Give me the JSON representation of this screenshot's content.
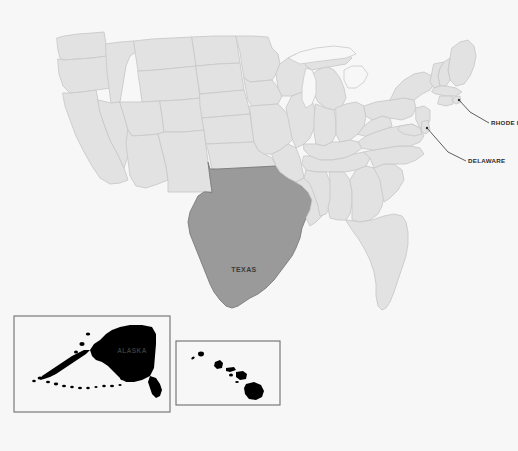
{
  "map": {
    "title": "United States map with Texas highlighted",
    "background_color": "#f7f7f7",
    "state_fill": "#e2e2e2",
    "state_stroke": "#c9c9c9",
    "highlight_fill": "#9a9a9a",
    "highlight_stroke": "#7a7a7a",
    "label_color": "#3a3a3a",
    "inset_border_color": "#6e6e6e",
    "highlighted_states": [
      "TEXAS",
      "ALASKA"
    ]
  },
  "labels": {
    "texas": "TEXAS",
    "alaska": "ALASKA"
  },
  "callouts": [
    {
      "id": "rhode-island",
      "text": "RHODE I"
    },
    {
      "id": "delaware",
      "text": "DELAWARE"
    }
  ],
  "insets": [
    {
      "id": "alaska-inset",
      "label": "ALASKA"
    },
    {
      "id": "hawaii-inset",
      "label": ""
    }
  ]
}
